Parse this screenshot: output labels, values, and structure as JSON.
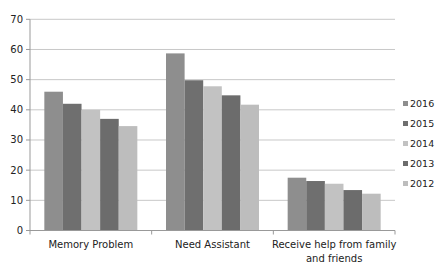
{
  "chart_data": {
    "type": "bar",
    "title": "",
    "xlabel": "",
    "ylabel": "",
    "ylim": [
      0,
      70
    ],
    "yticks": [
      0,
      10,
      20,
      30,
      40,
      50,
      60,
      70
    ],
    "grid": true,
    "legend_position": "right",
    "categories": [
      [
        "Memory Problem"
      ],
      [
        "Need Assistant"
      ],
      [
        "Receive help from family",
        "and friends"
      ]
    ],
    "category_names": [
      "Memory Problem",
      "Need Assistant",
      "Receive help from family and friends"
    ],
    "series": [
      {
        "name": "2016",
        "color": "#8e8e8e",
        "values": [
          46,
          58.7,
          17.5
        ]
      },
      {
        "name": "2015",
        "color": "#6f6f6f",
        "values": [
          42,
          49.8,
          16.4
        ]
      },
      {
        "name": "2014",
        "color": "#c2c2c2",
        "values": [
          40,
          47.8,
          15.5
        ]
      },
      {
        "name": "2013",
        "color": "#6c6c6c",
        "values": [
          37,
          44.8,
          13.4
        ]
      },
      {
        "name": "2012",
        "color": "#bdbdbd",
        "values": [
          34.6,
          41.7,
          12.2
        ]
      }
    ],
    "legend_order": [
      "2016",
      "2015",
      "2014",
      "2013",
      "2012"
    ]
  }
}
